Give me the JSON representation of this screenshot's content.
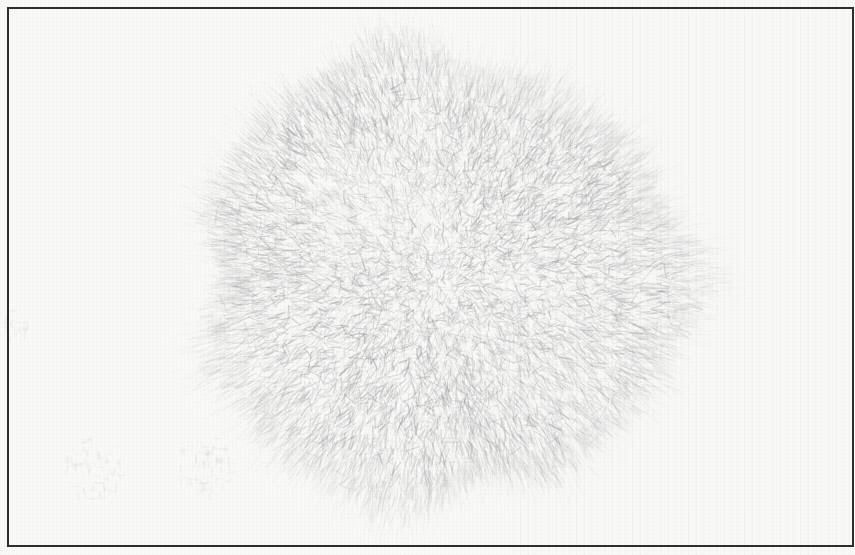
{
  "meta": {
    "medium": "pencil-on-paper"
  },
  "page": {
    "width": 855,
    "height": 555,
    "background": "#f9f9f7"
  },
  "frame": {
    "color": "#2d2d2d",
    "thickness": 2,
    "inset_top": 7,
    "inset_left": 7,
    "inset_bottom": 8,
    "inset_right": 1
  },
  "ball": {
    "center_x": 440,
    "center_y": 278,
    "radius_x": 242,
    "radius_y": 224,
    "body_stroke_count": 15000,
    "edge_hair_count": 3200,
    "gray_min": 128,
    "gray_max": 205,
    "seed": 20240512
  },
  "ghost_marks": {
    "gray": 152,
    "clusters": [
      {
        "x": 92,
        "y": 468,
        "w": 62,
        "h": 64,
        "count": 70
      },
      {
        "x": 206,
        "y": 464,
        "w": 58,
        "h": 62,
        "count": 70
      },
      {
        "x": 16,
        "y": 322,
        "w": 22,
        "h": 34,
        "count": 18
      }
    ]
  }
}
